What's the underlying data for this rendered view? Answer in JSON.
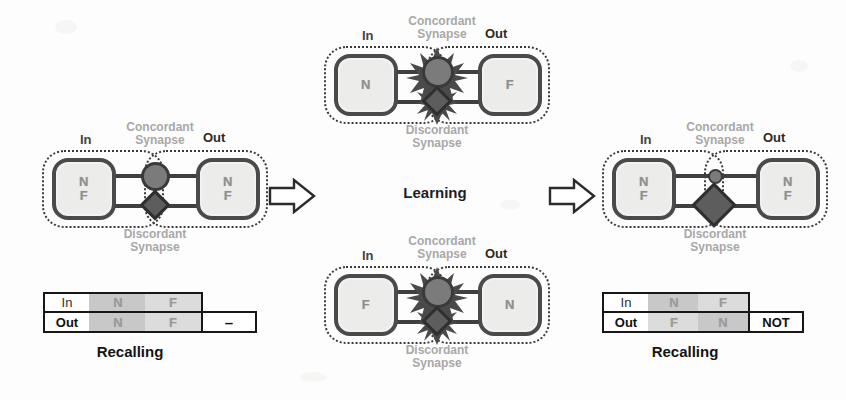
{
  "figure": {
    "background_color": "#fdfdfd",
    "line_color": "#3a3a3a",
    "neuron_fill": "#ececeb",
    "letter_color": "#8f8f8f",
    "synapse_circle_color": "#7b7b7b",
    "synapse_diamond_color": "#5d5d5d",
    "table_shade_dark": "#c8c8c8",
    "table_shade_light": "#dcdcdc"
  },
  "labels": {
    "in": "In",
    "out": "Out",
    "concordant_line1": "Concordant",
    "concordant_line2": "Synapse",
    "discordant_line1": "Discordant",
    "discordant_line2": "Synapse"
  },
  "stages": {
    "learning": "Learning",
    "recalling": "Recalling"
  },
  "panels": {
    "before": {
      "name": "before-learning-network",
      "in_values": [
        "N",
        "F"
      ],
      "out_values": [
        "N",
        "F"
      ],
      "concordant_state": "normal",
      "discordant_state": "normal",
      "active_burst": false
    },
    "training_top": {
      "name": "training-pair-n-f",
      "in_values": [
        "N"
      ],
      "out_values": [
        "F"
      ],
      "concordant_state": "firing",
      "discordant_state": "firing",
      "active_burst": true
    },
    "training_bottom": {
      "name": "training-pair-f-n",
      "in_values": [
        "F"
      ],
      "out_values": [
        "N"
      ],
      "concordant_state": "firing",
      "discordant_state": "firing",
      "active_burst": true
    },
    "after": {
      "name": "after-learning-network",
      "in_values": [
        "N",
        "F"
      ],
      "out_values": [
        "N",
        "F"
      ],
      "concordant_state": "weakened",
      "discordant_state": "strengthened",
      "active_burst": false
    }
  },
  "tables": {
    "before": {
      "caption": "Recalling",
      "row_labels": [
        "In",
        "Out"
      ],
      "in_row": [
        "N",
        "F"
      ],
      "out_row": [
        "N",
        "F"
      ],
      "tail": "–",
      "in_shades": [
        "dark",
        "light"
      ],
      "out_shades": [
        "dark",
        "light"
      ]
    },
    "after": {
      "caption": "Recalling",
      "row_labels": [
        "In",
        "Out"
      ],
      "in_row": [
        "N",
        "F"
      ],
      "out_row": [
        "F",
        "N"
      ],
      "tail": "NOT",
      "in_shades": [
        "dark",
        "light"
      ],
      "out_shades": [
        "light",
        "dark"
      ]
    }
  },
  "arrows": [
    {
      "name": "arrow-before-to-learning",
      "direction": "right"
    },
    {
      "name": "arrow-learning-to-after",
      "direction": "right"
    }
  ]
}
